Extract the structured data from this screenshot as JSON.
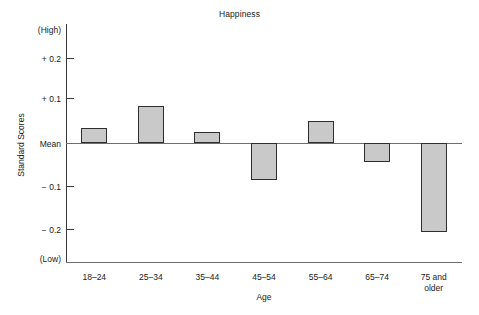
{
  "chart_data": {
    "type": "bar",
    "title": "Happiness",
    "xlabel": "Age",
    "ylabel": "Standard Scores",
    "categories": [
      "18–24",
      "25–34",
      "35–44",
      "45–54",
      "55–64",
      "65–74",
      "75 and\nolder"
    ],
    "values": [
      0.035,
      0.086,
      0.026,
      -0.086,
      0.051,
      -0.044,
      -0.207
    ],
    "ylim": [
      -0.28,
      0.28
    ],
    "ytick_values": [
      0.2,
      0.1,
      0,
      -0.1,
      -0.2
    ],
    "ytick_labels": [
      "+ 0.2",
      "+ 0.1",
      "Mean",
      "− 0.1",
      "− 0.2"
    ],
    "axis_end_labels": {
      "high": "(High)",
      "low": "(Low)"
    },
    "grid": false,
    "legend": null,
    "bar_fill_color": "#c9c9c9",
    "bar_edge_color": "#2e2e2e",
    "baseline_label": "Mean"
  }
}
